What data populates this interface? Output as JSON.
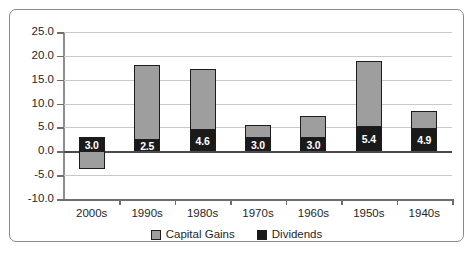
{
  "chart_data": {
    "type": "bar",
    "subtype": "stacked-bar",
    "title": "",
    "xlabel": "",
    "ylabel": "",
    "ylim": [
      -10.0,
      25.0
    ],
    "ytick_step": 5.0,
    "ytick_labels": [
      "25.0",
      "20.0",
      "15.0",
      "10.0",
      "5.0",
      "0.0",
      "-5.0",
      "-10.0"
    ],
    "ytick_values": [
      25.0,
      20.0,
      15.0,
      10.0,
      5.0,
      0.0,
      -5.0,
      -10.0
    ],
    "grid": true,
    "grid_axis": "y",
    "legend_position": "bottom-center",
    "categories": [
      "2000s",
      "1990s",
      "1980s",
      "1970s",
      "1960s",
      "1950s",
      "1940s"
    ],
    "series": [
      {
        "name": "Capital Gains",
        "color": "#9e9e9e",
        "values": [
          -3.8,
          15.5,
          12.6,
          2.6,
          4.4,
          13.6,
          3.6
        ],
        "labels": [
          "",
          "",
          "",
          "",
          "",
          "",
          ""
        ]
      },
      {
        "name": "Dividends",
        "color": "#1a1a1a",
        "values": [
          3.0,
          2.5,
          4.6,
          3.0,
          3.0,
          5.4,
          4.9
        ],
        "labels": [
          "3.0",
          "2.5",
          "4.6",
          "3.0",
          "3.0",
          "5.4",
          "4.9"
        ]
      }
    ],
    "totals": [
      -0.8,
      18.0,
      17.2,
      5.6,
      7.4,
      19.0,
      8.5
    ],
    "annotations": [
      "3.0",
      "2.5",
      "4.6",
      "3.0",
      "3.0",
      "5.4",
      "4.9"
    ]
  },
  "legend": {
    "items": [
      {
        "label": "Capital Gains",
        "color": "#9e9e9e"
      },
      {
        "label": "Dividends",
        "color": "#1a1a1a"
      }
    ]
  },
  "colors": {
    "capital_gains": "#9e9e9e",
    "dividends": "#1a1a1a",
    "gridline": "#c9c9c9",
    "axis": "#6e6e6e",
    "frame_border": "#8a8a8a",
    "text": "#262626"
  }
}
